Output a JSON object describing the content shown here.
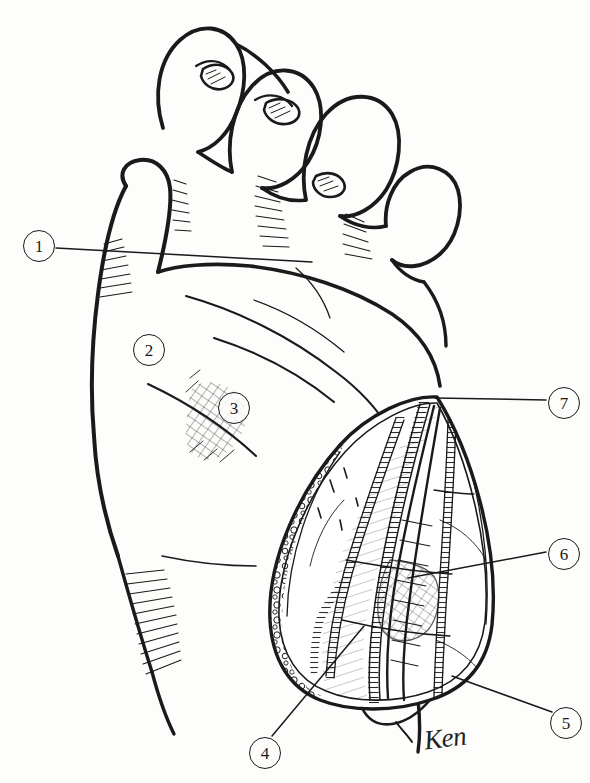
{
  "figure": {
    "medium": "pen-and-ink line illustration",
    "background_color": "#fdfdfb",
    "ink_color": "#1a1a1a",
    "width": 590,
    "height": 783
  },
  "callouts": [
    {
      "id": "1",
      "label": "1",
      "x": 23,
      "y": 230,
      "leader": true,
      "leader_to_x": 160,
      "leader_to_y": 258
    },
    {
      "id": "2",
      "label": "2",
      "x": 133,
      "y": 334,
      "leader": false
    },
    {
      "id": "3",
      "label": "3",
      "x": 218,
      "y": 392,
      "leader": false
    },
    {
      "id": "4",
      "label": "4",
      "x": 249,
      "y": 737,
      "leader": true,
      "leader_to_x": 360,
      "leader_to_y": 630
    },
    {
      "id": "5",
      "label": "5",
      "x": 550,
      "y": 707,
      "leader": true,
      "leader_to_x": 454,
      "leader_to_y": 678
    },
    {
      "id": "6",
      "label": "6",
      "x": 548,
      "y": 538,
      "leader": true,
      "leader_to_x": 415,
      "leader_to_y": 576
    },
    {
      "id": "7",
      "label": "7",
      "x": 548,
      "y": 387,
      "leader": true,
      "leader_to_x": 437,
      "leader_to_y": 397
    }
  ],
  "signature": {
    "text": "Ken",
    "x": 424,
    "y": 723
  },
  "regions": [
    {
      "name": "thumb",
      "description": "thumb extending down-left along palm radial border"
    },
    {
      "name": "index-finger",
      "description": "curled index finger, nail visible"
    },
    {
      "name": "middle-finger",
      "description": "curled middle finger, nail visible"
    },
    {
      "name": "ring-finger",
      "description": "curled ring finger"
    },
    {
      "name": "little-finger",
      "description": "curled little finger"
    },
    {
      "name": "palm",
      "description": "open palm surface with flexion creases"
    },
    {
      "name": "thenar-crosshatch",
      "description": "cross-hatched shaded area over thenar eminence near label 3"
    },
    {
      "name": "wrist",
      "description": "wrist and distal forearm below palm"
    },
    {
      "name": "incision-wound",
      "description": "open longitudinal surgical wound over palm and wrist"
    },
    {
      "name": "fat-lobules",
      "description": "bubbly subcutaneous fat texture along wound margins"
    },
    {
      "name": "nerve-bundle",
      "description": "ladder-hatched nerve structures within wound"
    },
    {
      "name": "tendon-bundle",
      "description": "cross-hatched tendon structures within wound"
    }
  ]
}
